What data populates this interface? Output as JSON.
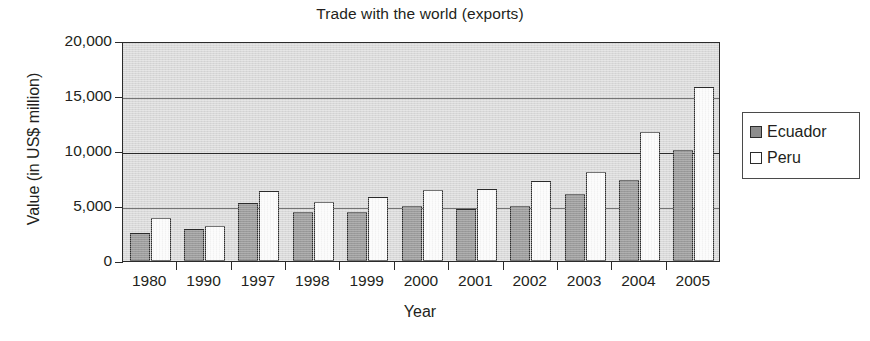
{
  "chart_data": {
    "type": "bar",
    "title": "Trade with the world (exports)",
    "xlabel": "Year",
    "ylabel": "Value (in US$ million)",
    "categories": [
      "1980",
      "1990",
      "1997",
      "1998",
      "1999",
      "2000",
      "2001",
      "2002",
      "2003",
      "2004",
      "2005"
    ],
    "series": [
      {
        "name": "Ecuador",
        "color": "#8d8d8d",
        "values": [
          2550,
          2900,
          5250,
          4450,
          4450,
          5000,
          4700,
          5000,
          6050,
          7350,
          10100
        ]
      },
      {
        "name": "Peru",
        "color": "#ffffff",
        "values": [
          3900,
          3200,
          6350,
          5400,
          5800,
          6450,
          6550,
          7250,
          8100,
          11700,
          15800
        ]
      }
    ],
    "ylim": [
      0,
      20000
    ],
    "yticks": [
      0,
      5000,
      10000,
      15000,
      20000
    ],
    "ytick_labels": [
      "0",
      "5,000",
      "10,000",
      "15,000",
      "20,000"
    ],
    "grid": true,
    "grid_axis": "y",
    "legend_position": "right-outside",
    "plot_background": "#d9d9d9",
    "axis_color": "#2b2b2b"
  },
  "legend": {
    "items": [
      {
        "label": "Ecuador",
        "swatch": "ecuador-swatch"
      },
      {
        "label": "Peru",
        "swatch": "peru-swatch"
      }
    ]
  }
}
